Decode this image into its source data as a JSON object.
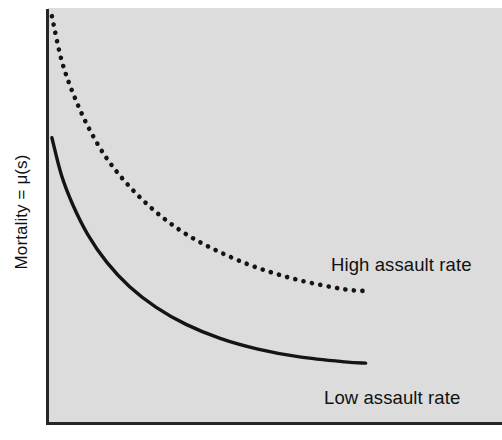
{
  "chart_data": {
    "type": "line",
    "title": "",
    "subtitle": "",
    "xlabel": "",
    "ylabel": "Mortality = μ(s)",
    "grid": false,
    "legend_position": "inline-annotation",
    "axis_style": {
      "y_axis_visible": true,
      "x_axis_visible": true,
      "tick_labels": false,
      "panel_background": "#dcdcdc"
    },
    "xlim": [
      0,
      1
    ],
    "ylim": [
      0,
      1
    ],
    "annotations": [
      {
        "text": "High assault rate",
        "series": "high-assault-rate"
      },
      {
        "text": "Low assault rate",
        "series": "low-assault-rate"
      }
    ],
    "series": [
      {
        "name": "High assault rate",
        "style": "dotted",
        "color": "#141414",
        "x": [
          0.005,
          0.03,
          0.06,
          0.1,
          0.15,
          0.21,
          0.28,
          0.36,
          0.45,
          0.55,
          0.66,
          0.78,
          0.84
        ],
        "y": [
          0.985,
          0.88,
          0.8,
          0.718,
          0.64,
          0.572,
          0.51,
          0.456,
          0.412,
          0.374,
          0.344,
          0.322,
          0.318
        ]
      },
      {
        "name": "Low assault rate",
        "style": "solid",
        "color": "#141414",
        "x": [
          0.005,
          0.03,
          0.06,
          0.1,
          0.15,
          0.21,
          0.28,
          0.36,
          0.45,
          0.55,
          0.66,
          0.78,
          0.835
        ],
        "y": [
          0.69,
          0.6,
          0.528,
          0.455,
          0.388,
          0.329,
          0.279,
          0.237,
          0.203,
          0.177,
          0.158,
          0.146,
          0.143
        ]
      }
    ]
  },
  "axis": {
    "y_title": "Mortality = μ(s)"
  },
  "labels": {
    "high": "High assault rate",
    "low": "Low assault rate"
  },
  "colors": {
    "panel": "#dcdcdc",
    "axis": "#262626",
    "curve": "#141414",
    "text": "#111111",
    "page": "#ffffff"
  }
}
